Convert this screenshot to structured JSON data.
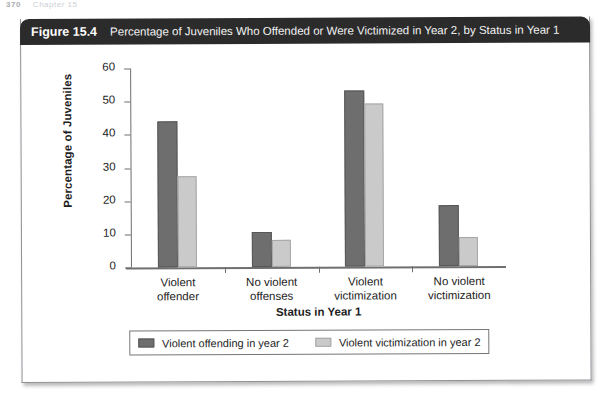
{
  "page_remnant": {
    "page_number": "370",
    "running_head": "Chapter 15"
  },
  "figure": {
    "label": "Figure 15.4",
    "title": "Percentage of Juveniles Who Offended or Were Victimized in Year 2, by Status in Year 1"
  },
  "colors": {
    "header_bar": "#2b2b2b",
    "series_1": "#6e6e6e",
    "series_2": "#cacaca",
    "axis": "#6f6f6f",
    "text": "#1d1d1d"
  },
  "chart_data": {
    "type": "bar",
    "title": "Percentage of Juveniles Who Offended or Were Victimized in Year 2, by Status in Year 1",
    "xlabel": "Status in Year 1",
    "ylabel": "Percentage of Juveniles",
    "ylim": [
      0,
      60
    ],
    "yticks": [
      0,
      10,
      20,
      30,
      40,
      50,
      60
    ],
    "ytick_labels": [
      "0",
      "10",
      "20",
      "30",
      "40",
      "50",
      "60"
    ],
    "grid": false,
    "legend_position": "below-axes",
    "categories": [
      "Violent offender",
      "No violent offenses",
      "Violent victimization",
      "No violent victimization"
    ],
    "category_lines": [
      [
        "Violent",
        "offender"
      ],
      [
        "No violent",
        "offenses"
      ],
      [
        "Violent",
        "victimization"
      ],
      [
        "No violent",
        "victimization"
      ]
    ],
    "series": [
      {
        "name": "Violent offending in year 2",
        "color": "#6e6e6e",
        "values": [
          44,
          10.5,
          53,
          18.5
        ]
      },
      {
        "name": "Violent victimization in year 2",
        "color": "#cacaca",
        "values": [
          27.3,
          8,
          49,
          8.7
        ]
      }
    ]
  }
}
